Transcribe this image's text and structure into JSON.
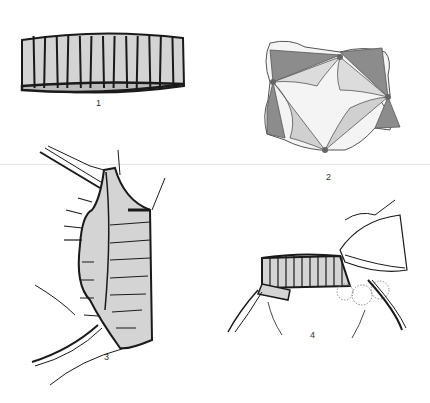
{
  "figure": {
    "panels": [
      {
        "id": 1,
        "label": "1",
        "subject": "cylindrical segmented band (ring of rectangular segments)"
      },
      {
        "id": 2,
        "label": "2",
        "subject": "four-cusp valve viewed from above with dark and light leaflet regions and four dots at commissures"
      },
      {
        "id": 3,
        "label": "3",
        "subject": "segmented band placed in tissue with retractors and arrows"
      },
      {
        "id": 4,
        "label": "4",
        "subject": "segmented band being positioned with hand holding tissue"
      }
    ],
    "colors": {
      "band_fill": "#d4d4d4",
      "outline": "#1a1a1a",
      "valve_dark": "#8c8c8c",
      "valve_light": "#dcdcdc",
      "valve_mid": "#bdbdbd",
      "dot": "#666666"
    }
  }
}
